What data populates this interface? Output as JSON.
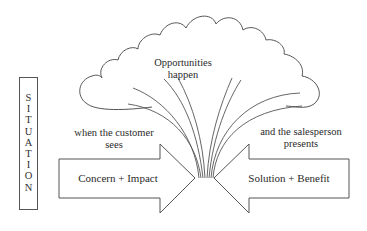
{
  "cloud": {
    "label_line1": "Opportunities",
    "label_line2": "happen"
  },
  "situation": {
    "label": "SITUATION",
    "letters": [
      "S",
      "I",
      "T",
      "U",
      "A",
      "T",
      "I",
      "O",
      "N"
    ]
  },
  "left_side": {
    "caption_line1": "when the customer",
    "caption_line2": "sees",
    "arrow_label": "Concern + Impact"
  },
  "right_side": {
    "caption_line1": "and the salesperson",
    "caption_line2": "presents",
    "arrow_label": "Solution + Benefit"
  },
  "colors": {
    "stroke": "#555555",
    "text": "#2a2a2a",
    "background": "#ffffff"
  }
}
